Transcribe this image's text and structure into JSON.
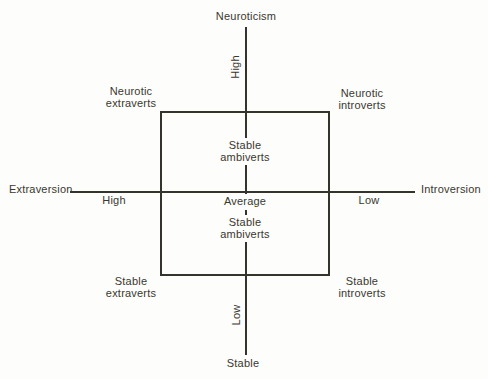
{
  "diagram": {
    "axes": {
      "top_label": "Neuroticism",
      "bottom_label": "Stable",
      "left_label": "Extraversion",
      "right_label": "Introversion",
      "vertical_high": "High",
      "vertical_low": "Low",
      "horizontal_high": "High",
      "horizontal_low": "Low",
      "center_label": "Average"
    },
    "quadrants": {
      "top_left": {
        "line1": "Neurotic",
        "line2": "extraverts"
      },
      "top_right": {
        "line1": "Neurotic",
        "line2": "introverts"
      },
      "bottom_left": {
        "line1": "Stable",
        "line2": "extraverts"
      },
      "bottom_right": {
        "line1": "Stable",
        "line2": "introverts"
      }
    },
    "center_zone": {
      "upper": {
        "line1": "Stable",
        "line2": "ambiverts"
      },
      "lower": {
        "line1": "Stable",
        "line2": "ambiverts"
      }
    },
    "colors": {
      "background": "#fdfdfb",
      "line": "#34332c",
      "text": "#3a382f"
    }
  }
}
